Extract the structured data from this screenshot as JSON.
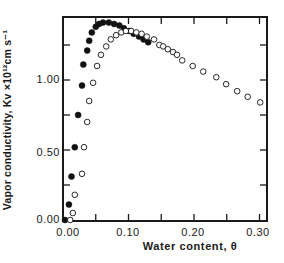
{
  "chart_data": {
    "type": "scatter",
    "title": "",
    "xlabel": "Water content, θ",
    "ylabel": "Vapor conductivity, Kv ×10¹²cm s⁻¹",
    "xlim": [
      0.0,
      0.31
    ],
    "ylim": [
      0.0,
      1.45
    ],
    "x_ticks": [
      "0.00",
      "0.10",
      "0.20",
      "0.30"
    ],
    "y_ticks": [
      "0.00",
      "0.50",
      "1.00"
    ],
    "grid": false,
    "legend": null,
    "series": [
      {
        "name": "filled circles",
        "marker": "filled-circle",
        "x": [
          0.003,
          0.009,
          0.013,
          0.018,
          0.023,
          0.029,
          0.031,
          0.037,
          0.04,
          0.044,
          0.05,
          0.055,
          0.061,
          0.07,
          0.078,
          0.086,
          0.093,
          0.101,
          0.108,
          0.116,
          0.123,
          0.13
        ],
        "y": [
          0.0,
          0.11,
          0.31,
          0.52,
          0.75,
          0.96,
          1.11,
          1.21,
          1.28,
          1.34,
          1.38,
          1.4,
          1.41,
          1.41,
          1.4,
          1.39,
          1.37,
          1.35,
          1.33,
          1.31,
          1.29,
          1.27
        ]
      },
      {
        "name": "open circles",
        "marker": "open-circle",
        "x": [
          0.011,
          0.015,
          0.018,
          0.029,
          0.032,
          0.037,
          0.04,
          0.046,
          0.052,
          0.058,
          0.066,
          0.073,
          0.081,
          0.089,
          0.096,
          0.104,
          0.112,
          0.12,
          0.128,
          0.139,
          0.147,
          0.153,
          0.16,
          0.168,
          0.174,
          0.182,
          0.198,
          0.214,
          0.234,
          0.249,
          0.266,
          0.282,
          0.301
        ],
        "y": [
          0.0,
          0.05,
          0.18,
          0.33,
          0.52,
          0.7,
          0.85,
          0.98,
          1.1,
          1.18,
          1.24,
          1.29,
          1.32,
          1.34,
          1.35,
          1.35,
          1.34,
          1.33,
          1.31,
          1.29,
          1.25,
          1.24,
          1.22,
          1.2,
          1.18,
          1.14,
          1.1,
          1.06,
          1.02,
          0.97,
          0.92,
          0.88,
          0.84
        ]
      }
    ]
  },
  "labels": {
    "ylabel": "Vapor conductivity, Kv ×10¹²cm s⁻¹",
    "xlabel": "Water content, θ",
    "yticks": [
      "0.00",
      "0.50",
      "1.00"
    ],
    "xticks": [
      "0.00",
      "0.10",
      "0.20",
      "0.30"
    ]
  }
}
